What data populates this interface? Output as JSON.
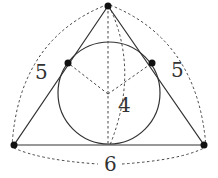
{
  "diagram": {
    "vertices": {
      "apex": [
        108,
        6
      ],
      "bottom_left": [
        14,
        145
      ],
      "bottom_right": [
        204,
        145
      ]
    },
    "tangent_points": {
      "left": [
        68,
        63
      ],
      "right": [
        152,
        63
      ],
      "bottom": [
        109,
        145
      ]
    },
    "incircle": {
      "cx": 109,
      "cy": 93,
      "r": 51
    },
    "incenter": [
      108,
      94
    ],
    "labels": {
      "left_side": "5",
      "right_side": "5",
      "height": "4",
      "base": "6"
    },
    "colors": {
      "stroke": "#333333",
      "dot": "#111111",
      "background": "#ffffff"
    }
  }
}
